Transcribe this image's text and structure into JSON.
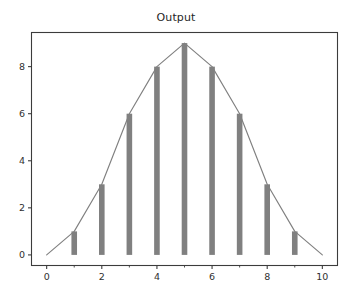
{
  "chart_data": {
    "type": "bar",
    "title": "Output",
    "xlabel": "",
    "ylabel": "",
    "x": [
      0,
      1,
      2,
      3,
      4,
      5,
      6,
      7,
      8,
      9,
      10
    ],
    "values": [
      0,
      1,
      3,
      6,
      8,
      9,
      8,
      6,
      3,
      1,
      0
    ],
    "categories": [
      "0",
      "1",
      "2",
      "3",
      "4",
      "5",
      "6",
      "7",
      "8",
      "9",
      "10"
    ],
    "series": [
      {
        "name": "Output",
        "values": [
          0,
          1,
          3,
          6,
          8,
          9,
          8,
          6,
          3,
          1,
          0
        ],
        "render": "bar+line"
      }
    ],
    "xlim": [
      -0.55,
      10.55
    ],
    "ylim": [
      -0.45,
      9.45
    ],
    "xticks": [
      0,
      2,
      4,
      6,
      8,
      10
    ],
    "xtick_labels": [
      "0",
      "2",
      "4",
      "6",
      "8",
      "10"
    ],
    "xminorticks": [
      1,
      3,
      5,
      7,
      9
    ],
    "yticks": [
      0,
      2,
      4,
      6,
      8
    ],
    "ytick_labels": [
      "0",
      "2",
      "4",
      "6",
      "8"
    ],
    "grid": false,
    "legend": null,
    "legend_position": "none",
    "bar_color": "#808080",
    "line_color": "#808080",
    "axes_color": "#3c3c3c",
    "background_color": "#ffffff"
  }
}
